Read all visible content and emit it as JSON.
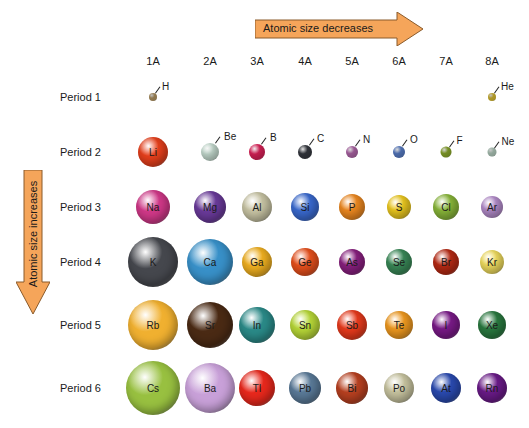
{
  "arrows": {
    "horizontal": {
      "label": "Atomic size decreases",
      "color": "#f5a55a"
    },
    "vertical": {
      "label": "Atomic size increases",
      "color": "#f5a55a"
    }
  },
  "groups": [
    "1A",
    "2A",
    "3A",
    "4A",
    "5A",
    "6A",
    "7A",
    "8A"
  ],
  "periods": [
    "Period 1",
    "Period 2",
    "Period 3",
    "Period 4",
    "Period 5",
    "Period 6"
  ],
  "elements": {
    "p1": [
      {
        "symbol": "H",
        "group": 0,
        "size": 8,
        "color": "#c8a870"
      },
      {
        "symbol": "He",
        "group": 7,
        "size": 8,
        "color": "#f2d23a"
      }
    ],
    "p2": [
      {
        "symbol": "Li",
        "group": 0,
        "size": 30,
        "color": "#e8401c"
      },
      {
        "symbol": "Be",
        "group": 1,
        "size": 18,
        "color": "#cfe6da"
      },
      {
        "symbol": "B",
        "group": 2,
        "size": 16,
        "color": "#e8245e"
      },
      {
        "symbol": "C",
        "group": 3,
        "size": 14,
        "color": "#3a3d45"
      },
      {
        "symbol": "N",
        "group": 4,
        "size": 12,
        "color": "#c070b8"
      },
      {
        "symbol": "O",
        "group": 5,
        "size": 12,
        "color": "#6088d8"
      },
      {
        "symbol": "F",
        "group": 6,
        "size": 11,
        "color": "#98b830"
      },
      {
        "symbol": "Ne",
        "group": 7,
        "size": 9,
        "color": "#c8e4d4"
      }
    ],
    "p3": [
      {
        "symbol": "Na",
        "group": 0,
        "size": 34,
        "color": "#d03888"
      },
      {
        "symbol": "Mg",
        "group": 1,
        "size": 32,
        "color": "#6a3a9a"
      },
      {
        "symbol": "Al",
        "group": 2,
        "size": 30,
        "color": "#c8c4a4"
      },
      {
        "symbol": "Si",
        "group": 3,
        "size": 28,
        "color": "#3a6ad0"
      },
      {
        "symbol": "P",
        "group": 4,
        "size": 26,
        "color": "#f08a20"
      },
      {
        "symbol": "S",
        "group": 5,
        "size": 24,
        "color": "#f0cc20"
      },
      {
        "symbol": "Cl",
        "group": 6,
        "size": 26,
        "color": "#8ab83a"
      },
      {
        "symbol": "Ar",
        "group": 7,
        "size": 22,
        "color": "#b890d0"
      }
    ],
    "p4": [
      {
        "symbol": "K",
        "group": 0,
        "size": 50,
        "color": "#45474d"
      },
      {
        "symbol": "Ca",
        "group": 1,
        "size": 46,
        "color": "#3890c8"
      },
      {
        "symbol": "Ga",
        "group": 2,
        "size": 30,
        "color": "#f0b020"
      },
      {
        "symbol": "Ge",
        "group": 3,
        "size": 28,
        "color": "#e8501c"
      },
      {
        "symbol": "As",
        "group": 4,
        "size": 26,
        "color": "#8a2080"
      },
      {
        "symbol": "Se",
        "group": 5,
        "size": 26,
        "color": "#3a8a58"
      },
      {
        "symbol": "Br",
        "group": 6,
        "size": 26,
        "color": "#b82a14"
      },
      {
        "symbol": "Kr",
        "group": 7,
        "size": 24,
        "color": "#f4e060"
      }
    ],
    "p5": [
      {
        "symbol": "Rb",
        "group": 0,
        "size": 50,
        "color": "#f0b030"
      },
      {
        "symbol": "Sr",
        "group": 1,
        "size": 46,
        "color": "#4a2a14"
      },
      {
        "symbol": "In",
        "group": 2,
        "size": 36,
        "color": "#2a8a88"
      },
      {
        "symbol": "Sn",
        "group": 3,
        "size": 30,
        "color": "#b8d838"
      },
      {
        "symbol": "Sb",
        "group": 4,
        "size": 30,
        "color": "#e83a1c"
      },
      {
        "symbol": "Te",
        "group": 5,
        "size": 28,
        "color": "#f09a20"
      },
      {
        "symbol": "I",
        "group": 6,
        "size": 28,
        "color": "#7a1a88"
      },
      {
        "symbol": "Xe",
        "group": 7,
        "size": 28,
        "color": "#2a7a40"
      }
    ],
    "p6": [
      {
        "symbol": "Cs",
        "group": 0,
        "size": 54,
        "color": "#98c040"
      },
      {
        "symbol": "Ba",
        "group": 1,
        "size": 50,
        "color": "#c8a0d8"
      },
      {
        "symbol": "Tl",
        "group": 2,
        "size": 36,
        "color": "#e8281c"
      },
      {
        "symbol": "Pb",
        "group": 3,
        "size": 32,
        "color": "#5a7a98"
      },
      {
        "symbol": "Bi",
        "group": 4,
        "size": 32,
        "color": "#b84020"
      },
      {
        "symbol": "Po",
        "group": 5,
        "size": 30,
        "color": "#c8c4a0"
      },
      {
        "symbol": "At",
        "group": 6,
        "size": 30,
        "color": "#2a4ab0"
      },
      {
        "symbol": "Rn",
        "group": 7,
        "size": 30,
        "color": "#6a1a88"
      }
    ]
  }
}
